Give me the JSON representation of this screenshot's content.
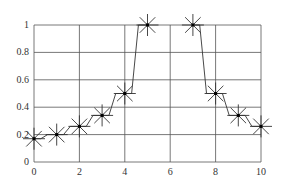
{
  "chart_data": {
    "type": "line",
    "title": "",
    "xlabel": "",
    "ylabel": "",
    "xlim": [
      0,
      10
    ],
    "ylim": [
      0,
      1
    ],
    "grid": true,
    "legend": null,
    "marker": "asterisk",
    "line_style": "step-like with diagonal transitions",
    "x_ticks": [
      "0",
      "2",
      "4",
      "6",
      "8",
      "10"
    ],
    "y_ticks": [
      "0",
      "0.2",
      "0.4",
      "0.6",
      "0.8",
      "1"
    ],
    "series": [
      {
        "name": "series1",
        "x": [
          0,
          1,
          2,
          3,
          4,
          5,
          7,
          8,
          9,
          10
        ],
        "values": [
          0.17,
          0.2,
          0.26,
          0.34,
          0.5,
          1.0,
          1.0,
          0.5,
          0.34,
          0.26
        ]
      }
    ]
  },
  "colors": {
    "line": "#333333",
    "grid": "#555555",
    "background": "#ffffff"
  }
}
